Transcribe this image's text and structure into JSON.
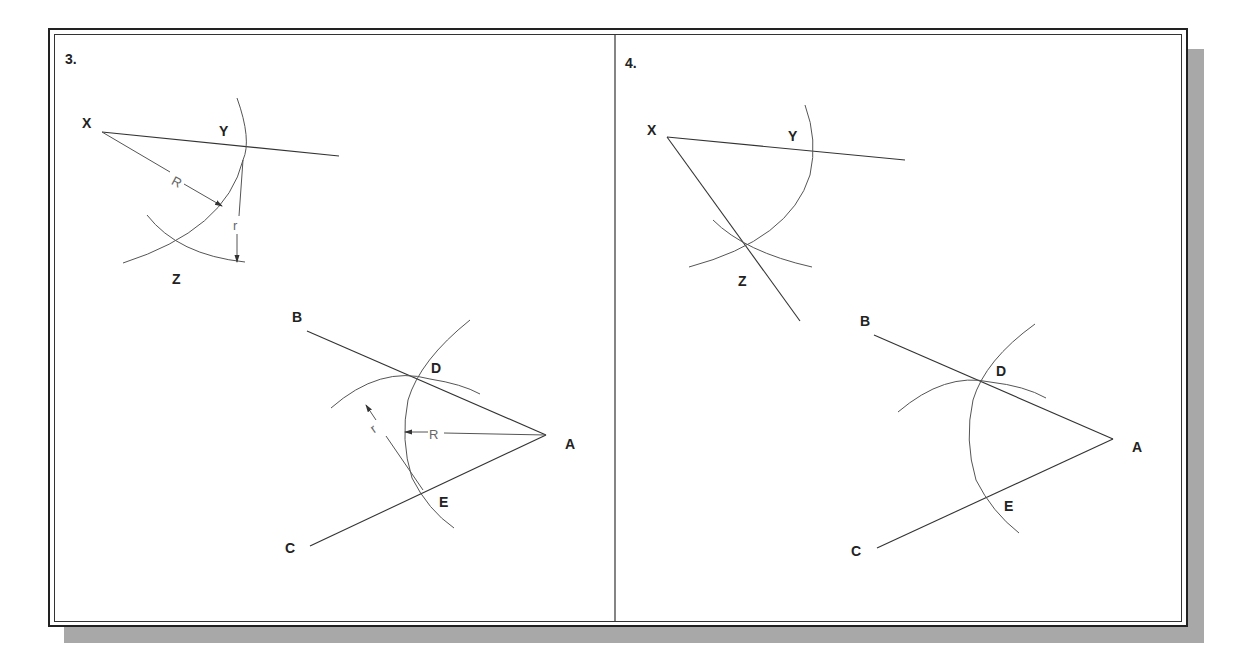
{
  "frame": {
    "shadow_color": "#a8a8a8",
    "border_color": "#222222"
  },
  "panels": [
    {
      "number": "3.",
      "labels": {
        "X": "X",
        "Y": "Y",
        "Z": "Z",
        "A": "A",
        "B": "B",
        "C": "C",
        "D": "D",
        "E": "E"
      },
      "dimensions": {
        "R_upper": "R",
        "r_upper": "r",
        "R_lower": "R",
        "r_lower": "r"
      }
    },
    {
      "number": "4.",
      "labels": {
        "X": "X",
        "Y": "Y",
        "Z": "Z",
        "A": "A",
        "B": "B",
        "C": "C",
        "D": "D",
        "E": "E"
      }
    }
  ]
}
